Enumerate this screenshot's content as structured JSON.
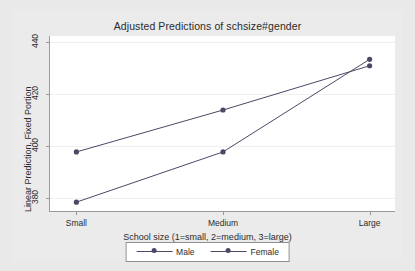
{
  "chart_data": {
    "type": "line",
    "title": "Adjusted Predictions of schsize#gender",
    "xlabel": "School size (1=small, 2=medium, 3=large)",
    "ylabel": "Linear Prediction, Fixed Portion",
    "categories": [
      "Small",
      "Medium",
      "Large"
    ],
    "x": [
      1,
      2,
      3
    ],
    "series": [
      {
        "name": "Male",
        "values": [
          397.7,
          413.9,
          431.0
        ],
        "color": "#4a4a66",
        "marker": "circle"
      },
      {
        "name": "Female",
        "values": [
          378.3,
          397.7,
          433.5
        ],
        "color": "#4a4a66",
        "marker": "circle"
      }
    ],
    "yticks": [
      380,
      400,
      420,
      440
    ],
    "ytick_labels": [
      "380",
      "400",
      "420",
      "440"
    ],
    "ylim": [
      374.5,
      442.5
    ],
    "xlim": [
      0.82,
      3.18
    ],
    "grid": true,
    "grid_axis": "y",
    "legend_position": "bottom",
    "legend_entries": [
      "Male",
      "Female"
    ]
  },
  "colors": {
    "background": "#e9e9e9",
    "graph_region": "#ebebeb",
    "plot_background": "#ffffff",
    "axis": "#9a9a9a",
    "gridline": "#f0f0f0",
    "series": "#4a4a66",
    "text": "#2b2b2b"
  }
}
